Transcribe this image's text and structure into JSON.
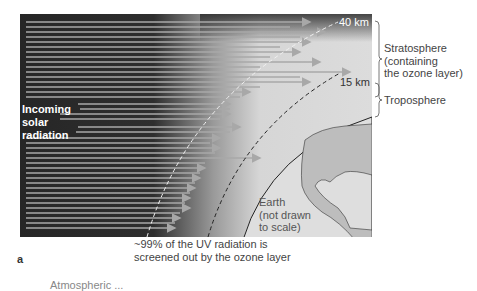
{
  "figure": {
    "panel_label": "a",
    "incoming_label": [
      "Incoming",
      "solar",
      "radiation"
    ],
    "altitude_markers": {
      "upper": "40 km",
      "lower": "15 km"
    },
    "layers": {
      "stratosphere": [
        "Stratosphere",
        "(containing",
        "the ozone layer)"
      ],
      "troposphere": "Troposphere"
    },
    "earth_label": [
      "Earth",
      "(not drawn",
      "to scale)"
    ],
    "caption": [
      "~99% of the UV radiation is",
      "screened out by the ozone layer"
    ],
    "cutoff_text": "Atmospheric ..."
  },
  "colors": {
    "space": "#2a2a2a",
    "atmosphere_light": "#d9d9d9",
    "earth_land": "#bfbfbf",
    "ocean": "#e2e2e2",
    "ray": "#a8a8a8",
    "text": "#444444"
  }
}
